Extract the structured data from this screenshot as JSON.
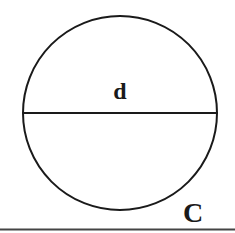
{
  "diagram": {
    "shape": "circle",
    "labels": {
      "diameter": "d",
      "circumference": "C"
    },
    "colors": {
      "stroke": "#1a1a1a",
      "background": "#ffffff"
    }
  }
}
